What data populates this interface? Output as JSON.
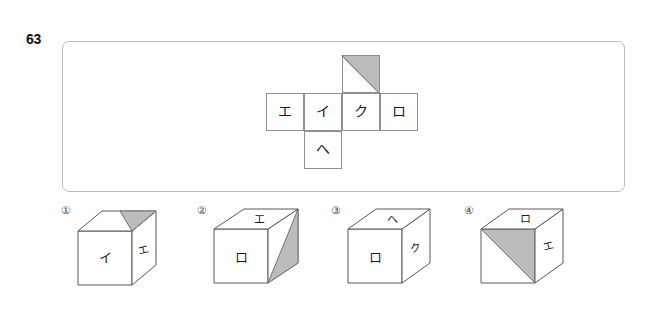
{
  "question": {
    "number": "63",
    "type": "cube-net-folding"
  },
  "net": {
    "description": "Cube net in cross layout with four Japanese katakana labels and one half-shaded face",
    "grid": {
      "rows": 3,
      "cols": 4
    },
    "cells": [
      {
        "row": 0,
        "col": 2,
        "label": "",
        "shaded": "upper-right-triangle"
      },
      {
        "row": 1,
        "col": 0,
        "label": "エ",
        "shaded": "none"
      },
      {
        "row": 1,
        "col": 1,
        "label": "イ",
        "shaded": "none"
      },
      {
        "row": 1,
        "col": 2,
        "label": "ク",
        "shaded": "none"
      },
      {
        "row": 1,
        "col": 3,
        "label": "ロ",
        "shaded": "none"
      },
      {
        "row": 2,
        "col": 1,
        "label": "へ",
        "shaded": "none"
      }
    ]
  },
  "options": [
    {
      "label": "①",
      "name": "option-1",
      "top_face": "",
      "front_face": "イ",
      "right_face": "エ",
      "shaded_face": "top-right-triangle"
    },
    {
      "label": "②",
      "name": "option-2",
      "top_face": "エ",
      "front_face": "ロ",
      "right_face": "",
      "shaded_face": "right-lower-triangle"
    },
    {
      "label": "③",
      "name": "option-3",
      "top_face": "へ",
      "front_face": "ロ",
      "right_face": "ク",
      "shaded_face": "none"
    },
    {
      "label": "④",
      "name": "option-4",
      "top_face": "ロ",
      "front_face": "",
      "right_face": "エ",
      "shaded_face": "front-upper-right-triangle"
    }
  ],
  "colors": {
    "shade_fill": "#bcbcbc",
    "line": "#55585c",
    "panel_border": "#b9bcc0",
    "text": "#1b1b1b",
    "background": "#ffffff"
  }
}
